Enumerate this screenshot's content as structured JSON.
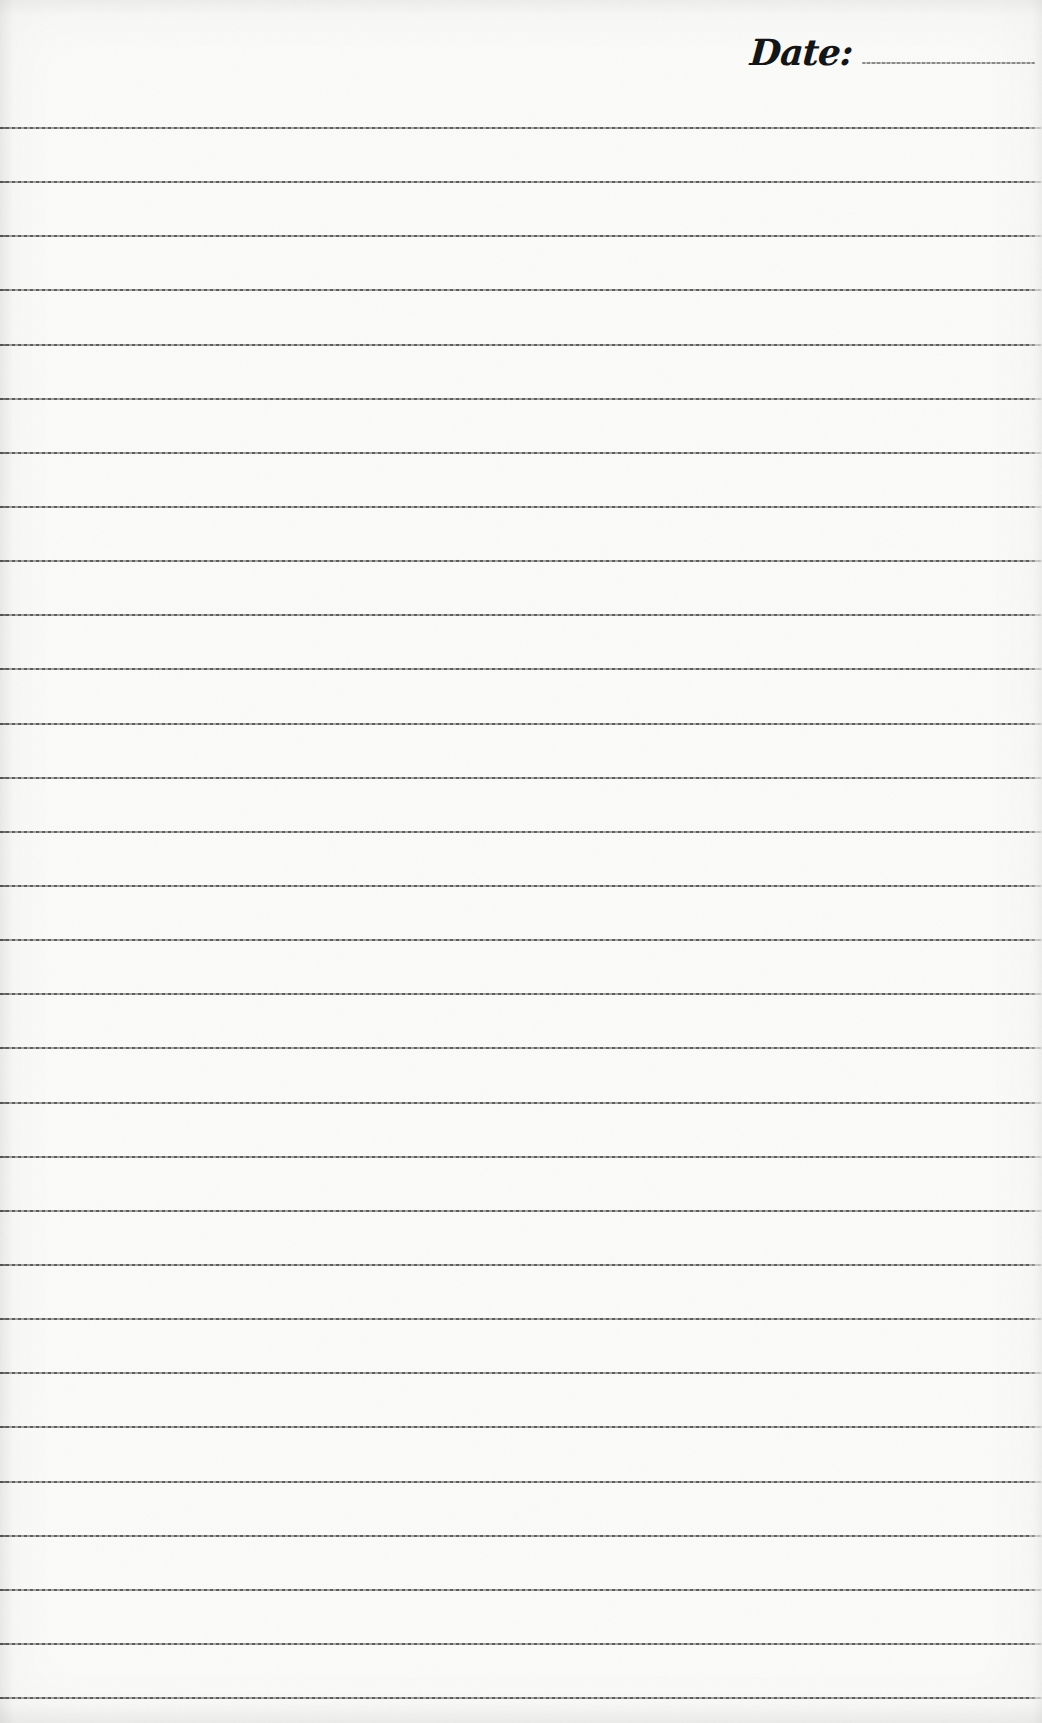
{
  "document": {
    "kind": "blank-lined-notebook-page",
    "header": {
      "date_label": "Date:",
      "date_value": ""
    },
    "paper": {
      "background_color": "#fbfbf9",
      "ruled_line_color": "#4f4f4f",
      "date_line_color": "#8a8a8a",
      "text_color": "#151515"
    },
    "ruled_lines": {
      "count": 30,
      "first_line_y": 127,
      "spacing": 54.14,
      "full_width": true
    }
  }
}
